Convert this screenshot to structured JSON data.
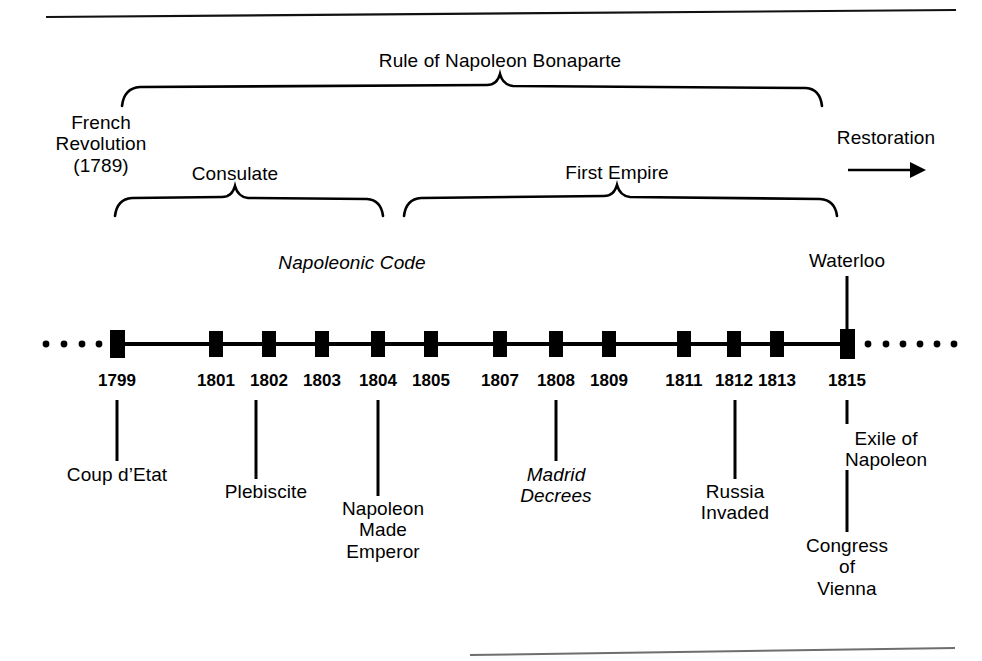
{
  "figure": {
    "kind": "historical-timeline",
    "subject": "Rule of Napoleon Bonaparte",
    "ink_color": "#000000",
    "background_color": "#ffffff"
  },
  "eras": {
    "top": {
      "label": "Rule of Napoleon Bonaparte"
    },
    "consulate": {
      "label": "Consulate"
    },
    "first_empire": {
      "label": "First Empire"
    }
  },
  "endpoints": {
    "left": {
      "label": "French\nRevolution\n(1789)"
    },
    "right": {
      "label": "Restoration",
      "arrow": "right-arrow-icon"
    }
  },
  "above_axis": [
    {
      "label": "Napoleonic Code",
      "style": "italic"
    },
    {
      "label": "Waterloo",
      "style": "normal"
    }
  ],
  "years": [
    "1799",
    "1801",
    "1802",
    "1803",
    "1804",
    "1805",
    "1807",
    "1808",
    "1809",
    "1811",
    "1812",
    "1813",
    "1815"
  ],
  "events": [
    {
      "year": "1799",
      "label": "Coup d’Etat",
      "style": "normal"
    },
    {
      "year": "1802",
      "label": "Plebiscite",
      "style": "normal"
    },
    {
      "year": "1804",
      "label": "Napoleon\nMade\nEmperor",
      "style": "normal"
    },
    {
      "year": "1808",
      "label": "Madrid\nDecrees",
      "style": "italic"
    },
    {
      "year": "1812",
      "label": "Russia\nInvaded",
      "style": "normal"
    },
    {
      "year": "1815",
      "label": "Exile of\nNapoleon",
      "style": "normal"
    },
    {
      "year": "1815",
      "label": "Congress\nof\nVienna",
      "style": "normal"
    }
  ],
  "axis": {
    "leading_dots": 4,
    "trailing_dots": 6,
    "marker_shape": "filled-rectangle"
  }
}
